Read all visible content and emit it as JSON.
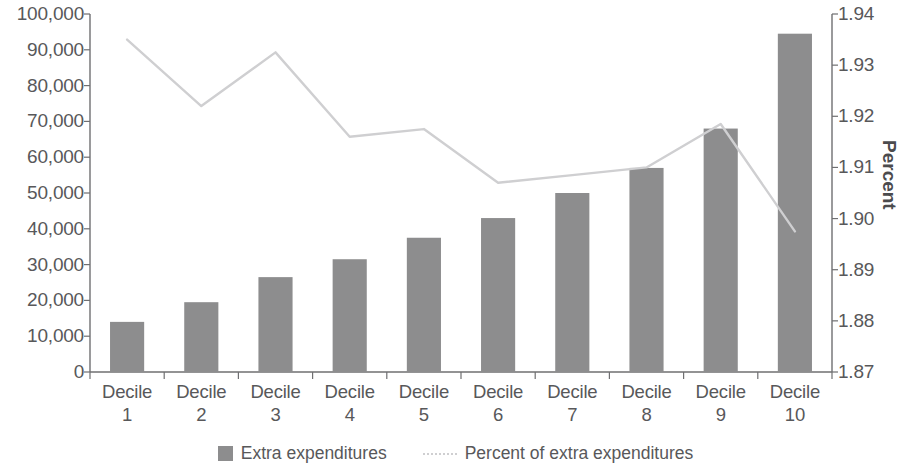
{
  "chart_data": {
    "type": "bar",
    "title": "",
    "xlabel": "",
    "ylabel": "",
    "y2label": "Percent",
    "categories": [
      "Decile 1",
      "Decile 2",
      "Decile 3",
      "Decile 4",
      "Decile 5",
      "Decile 6",
      "Decile 7",
      "Decile 8",
      "Decile 9",
      "Decile 10"
    ],
    "category_lines": [
      [
        "Decile",
        "1"
      ],
      [
        "Decile",
        "2"
      ],
      [
        "Decile",
        "3"
      ],
      [
        "Decile",
        "4"
      ],
      [
        "Decile",
        "5"
      ],
      [
        "Decile",
        "6"
      ],
      [
        "Decile",
        "7"
      ],
      [
        "Decile",
        "8"
      ],
      [
        "Decile",
        "9"
      ],
      [
        "Decile",
        "10"
      ]
    ],
    "series": [
      {
        "name": "Extra expenditures",
        "type": "bar",
        "axis": "left",
        "color": "#8d8d8e",
        "values": [
          14000,
          19500,
          26500,
          31500,
          37500,
          43000,
          50000,
          57000,
          68000,
          94500
        ]
      },
      {
        "name": "Percent of extra expenditures",
        "type": "line",
        "axis": "right",
        "color": "#cfcfd1",
        "values": [
          1.935,
          1.922,
          1.9325,
          1.916,
          1.9175,
          1.907,
          1.9085,
          1.91,
          1.9185,
          1.8975
        ]
      }
    ],
    "ylim": [
      0,
      100000
    ],
    "y2lim": [
      1.87,
      1.94
    ],
    "yticks": [
      0,
      10000,
      20000,
      30000,
      40000,
      50000,
      60000,
      70000,
      80000,
      90000,
      100000
    ],
    "ytick_labels": [
      "0",
      "10,000",
      "20,000",
      "30,000",
      "40,000",
      "50,000",
      "60,000",
      "70,000",
      "80,000",
      "90,000",
      "100,000"
    ],
    "y2ticks": [
      1.87,
      1.88,
      1.89,
      1.9,
      1.91,
      1.92,
      1.93,
      1.94
    ],
    "y2tick_labels": [
      "1.87",
      "1.88",
      "1.89",
      "1.90",
      "1.91",
      "1.92",
      "1.93",
      "1.94"
    ],
    "grid": false,
    "legend_position": "bottom",
    "legend": [
      {
        "label": "Extra expenditures",
        "marker": "bar-swatch",
        "color": "#8d8d8e"
      },
      {
        "label": "Percent of extra expenditures",
        "marker": "dotted-line",
        "color": "#cfcfd1"
      }
    ]
  },
  "axis_title_right": "Percent",
  "colors": {
    "bar": "#8d8d8e",
    "line": "#cfcfd1",
    "axis": "#6f6f71",
    "text": "#58585a",
    "background": "#ffffff"
  }
}
